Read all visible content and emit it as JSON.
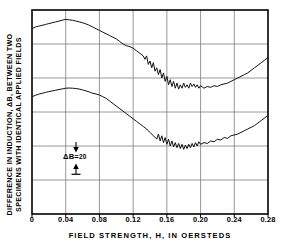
{
  "axes": {
    "xlabel": "FIELD STRENGTH, H, IN OERSTEDS",
    "ylabel_line1": "DIFFERENCE IN INDUCTION, ΔB, BETWEEN TWO",
    "ylabel_line2": "SPECIMENS WITH IDENTICAL APPLIED FIELDS",
    "xticks": [
      "0",
      "0.04",
      "0.08",
      "0.12",
      "0.16",
      "0.20",
      "0.24",
      "0.28"
    ],
    "ytick_labels": []
  },
  "annotation": {
    "symbol": "ΔB=",
    "value": "20",
    "full": "ΔB=20"
  },
  "chart_data": {
    "type": "line",
    "title": "",
    "xlabel": "FIELD STRENGTH, H, IN OERSTEDS",
    "ylabel": "DIFFERENCE IN INDUCTION, ΔB, BETWEEN TWO SPECIMENS WITH IDENTICAL APPLIED FIELDS",
    "xlim": [
      0,
      0.28
    ],
    "ylim": [
      0,
      120
    ],
    "grid": true,
    "legend": null,
    "xticks": [
      0,
      0.04,
      0.08,
      0.12,
      0.16,
      0.2,
      0.24,
      0.28
    ],
    "ygrid_spacing": 20,
    "scale_bar": {
      "label": "ΔB=20",
      "delta_b": 20
    },
    "series": [
      {
        "name": "upper-trace",
        "comment": "Barkhausen-noise difference trace, upper specimen pair",
        "x": [
          0,
          0.004,
          0.008,
          0.012,
          0.016,
          0.02,
          0.024,
          0.028,
          0.032,
          0.036,
          0.04,
          0.044,
          0.048,
          0.052,
          0.056,
          0.06,
          0.064,
          0.068,
          0.072,
          0.076,
          0.08,
          0.084,
          0.088,
          0.092,
          0.096,
          0.1,
          0.104,
          0.108,
          0.112,
          0.116,
          0.12,
          0.124,
          0.128,
          0.132,
          0.134,
          0.136,
          0.138,
          0.14,
          0.142,
          0.144,
          0.146,
          0.148,
          0.15,
          0.152,
          0.154,
          0.156,
          0.158,
          0.16,
          0.162,
          0.164,
          0.166,
          0.168,
          0.17,
          0.172,
          0.174,
          0.176,
          0.178,
          0.18,
          0.182,
          0.184,
          0.186,
          0.188,
          0.19,
          0.192,
          0.194,
          0.196,
          0.198,
          0.2,
          0.204,
          0.208,
          0.212,
          0.216,
          0.22,
          0.224,
          0.228,
          0.232,
          0.236,
          0.24,
          0.244,
          0.248,
          0.252,
          0.256,
          0.26,
          0.264,
          0.268,
          0.272,
          0.276,
          0.28
        ],
        "y": [
          109,
          110,
          110.5,
          111,
          111.5,
          112,
          112.5,
          113,
          113.5,
          114,
          114.5,
          114.2,
          114,
          113.5,
          113,
          112.5,
          111.8,
          111,
          110,
          109,
          108,
          107,
          106,
          105,
          104,
          103,
          101.5,
          100,
          99,
          98.5,
          97.5,
          96,
          94.5,
          93,
          91,
          93,
          88,
          90,
          86,
          89,
          84,
          86,
          82,
          85,
          80,
          83,
          78,
          81,
          76,
          79,
          75,
          78,
          74,
          77,
          73.5,
          76,
          74,
          77,
          74.5,
          76,
          74,
          77,
          75,
          76.5,
          74.5,
          76,
          74,
          75.5,
          74,
          75,
          74.5,
          75.5,
          75,
          76,
          76.5,
          77,
          78,
          79,
          80,
          81,
          82,
          83,
          84.5,
          86,
          87.5,
          89,
          90.5,
          92
        ]
      },
      {
        "name": "lower-trace",
        "comment": "Barkhausen-noise difference trace, lower specimen pair (offset downward)",
        "x": [
          0,
          0.004,
          0.008,
          0.012,
          0.016,
          0.02,
          0.024,
          0.028,
          0.032,
          0.036,
          0.04,
          0.044,
          0.048,
          0.052,
          0.056,
          0.06,
          0.064,
          0.068,
          0.072,
          0.076,
          0.08,
          0.084,
          0.088,
          0.092,
          0.096,
          0.1,
          0.104,
          0.108,
          0.112,
          0.116,
          0.12,
          0.124,
          0.128,
          0.132,
          0.136,
          0.14,
          0.144,
          0.148,
          0.15,
          0.152,
          0.154,
          0.156,
          0.158,
          0.16,
          0.162,
          0.164,
          0.166,
          0.168,
          0.17,
          0.172,
          0.174,
          0.176,
          0.178,
          0.18,
          0.182,
          0.184,
          0.186,
          0.188,
          0.19,
          0.192,
          0.194,
          0.196,
          0.198,
          0.2,
          0.204,
          0.208,
          0.212,
          0.216,
          0.22,
          0.224,
          0.228,
          0.232,
          0.236,
          0.24,
          0.244,
          0.248,
          0.252,
          0.256,
          0.26,
          0.264,
          0.268,
          0.272,
          0.276,
          0.28
        ],
        "y": [
          69,
          69.8,
          70.5,
          71,
          71.5,
          72,
          72.4,
          72.8,
          73.2,
          73.6,
          74,
          74.1,
          74,
          73.8,
          73.5,
          73,
          72.4,
          71.8,
          71,
          70.6,
          70,
          69,
          68,
          66.5,
          65,
          63.5,
          62,
          60.5,
          59,
          57.5,
          56,
          54.5,
          53,
          51.5,
          50,
          48,
          46,
          44,
          47,
          43,
          46,
          42,
          45,
          41,
          44,
          40,
          43,
          39.5,
          42,
          39,
          41.5,
          38.5,
          41,
          38,
          40.5,
          38.5,
          41,
          39,
          41.5,
          39.5,
          42,
          40,
          42.5,
          41,
          42,
          41.5,
          43,
          42.5,
          44,
          43.5,
          45,
          44.5,
          46,
          46.5,
          47,
          48,
          49,
          50,
          51,
          52,
          53.5,
          55,
          56.5,
          58
        ]
      }
    ]
  }
}
